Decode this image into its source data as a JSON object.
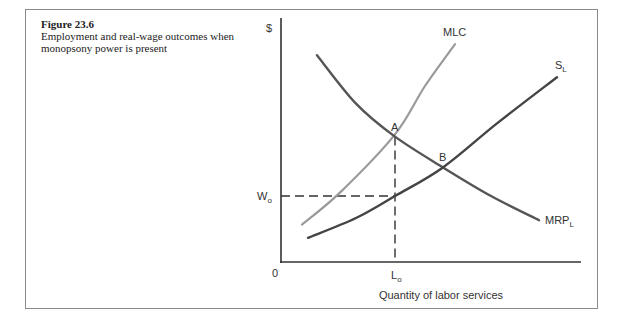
{
  "figure": {
    "number": "Figure 23.6",
    "description": "Employment and real-wage outcomes when monopsony power is present"
  },
  "chart_data": {
    "type": "line",
    "title": "Employment and real-wage outcomes when monopsony power is present",
    "xlabel": "Quantity of labor services",
    "ylabel": "$",
    "origin_label": "0",
    "xlim": [
      0,
      100
    ],
    "ylim": [
      0,
      100
    ],
    "grid": false,
    "series": [
      {
        "name": "MLC",
        "label": "MLC",
        "color": "#9a9a9a",
        "points": [
          [
            7,
            17
          ],
          [
            20,
            32
          ],
          [
            38,
            58
          ],
          [
            48,
            80
          ],
          [
            58,
            99
          ]
        ]
      },
      {
        "name": "MRP_L",
        "label_main": "MRP",
        "label_sub": "L",
        "color": "#555555",
        "points": [
          [
            12,
            94
          ],
          [
            25,
            72
          ],
          [
            38,
            57
          ],
          [
            54,
            43
          ],
          [
            70,
            30
          ],
          [
            86,
            19
          ]
        ]
      },
      {
        "name": "S_L",
        "label_main": "S",
        "label_sub": "L",
        "color": "#444444",
        "points": [
          [
            9,
            11
          ],
          [
            25,
            20
          ],
          [
            38,
            30
          ],
          [
            54,
            43
          ],
          [
            72,
            63
          ],
          [
            92,
            84
          ]
        ]
      }
    ],
    "points": [
      {
        "label": "A",
        "x": 38,
        "y": 57
      },
      {
        "label": "B",
        "x": 54,
        "y": 43
      }
    ],
    "reference_lines": [
      {
        "type": "horizontal",
        "y": 30,
        "label_main": "W",
        "label_sub": "o",
        "from_x": 0,
        "to_x": 38
      },
      {
        "type": "vertical",
        "x": 38,
        "label_main": "L",
        "label_sub": "o",
        "from_y": 0,
        "to_y": 57
      }
    ]
  }
}
